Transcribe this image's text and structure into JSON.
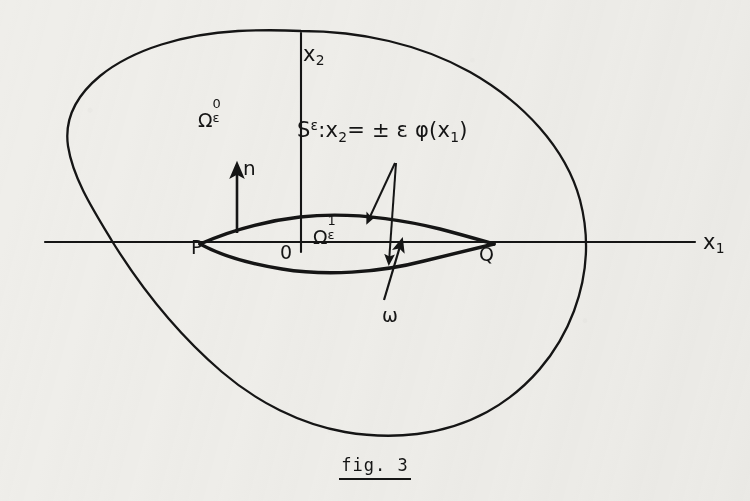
{
  "figure": {
    "caption": "fig. 3",
    "axes": {
      "x_axis_label": "x",
      "x_axis_sub": "1",
      "y_axis_label": "x",
      "y_axis_sub": "2"
    },
    "points": {
      "left_endpoint": "P",
      "origin": "0",
      "right_endpoint": "Q"
    },
    "labels": {
      "normal_vector": "n",
      "thin_domain": "ω",
      "outer_domain": {
        "base": "Ω",
        "superscript": "0",
        "subscript": "ε"
      },
      "inner_domain": {
        "base": "Ω",
        "superscript": "1",
        "subscript": "ε"
      },
      "surface_equation": {
        "symbol": "S",
        "symbol_sup": "ε",
        "colon": ":",
        "lhs": "x",
        "lhs_sub": "2",
        "eq": "=",
        "pm": "±",
        "eps": "ε",
        "phi": "φ",
        "open": "(",
        "arg": "x",
        "arg_sub": "1",
        "close": ")",
        "full_text": "Sᵉ:x₂= ± ε φ(x₁)"
      }
    },
    "colors": {
      "ink": "#151515",
      "paper": "#efeeea"
    }
  }
}
